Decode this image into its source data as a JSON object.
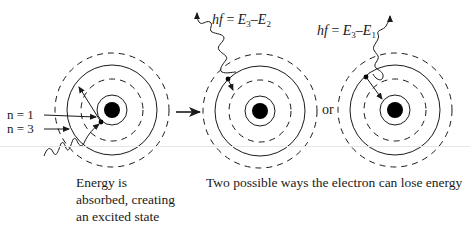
{
  "diagram": {
    "colors": {
      "ink": "#1a1a1a",
      "background": "#ffffff"
    },
    "atoms": [
      {
        "id": "absorbing-atom",
        "center": [
          112,
          110
        ],
        "labels": {
          "n1": "n = 1",
          "n3": "n = 3"
        },
        "caption_lines": [
          "Energy is",
          "absorbed, creating",
          "an excited state"
        ]
      },
      {
        "id": "emission-e3-e2",
        "center": [
          260,
          111
        ],
        "equation": {
          "lhs": "hf",
          "eq": " = ",
          "e_a": "E",
          "sub_a": "3",
          "minus": "–",
          "e_b": "E",
          "sub_b": "2"
        }
      },
      {
        "id": "emission-e3-e1",
        "center": [
          395,
          110
        ],
        "equation": {
          "lhs": "hf",
          "eq": " = ",
          "e_a": "E",
          "sub_a": "3",
          "minus": "–",
          "e_b": "E",
          "sub_b": "1"
        }
      }
    ],
    "connector_word": "or",
    "bottom_caption": "Two possible ways the electron can lose energy",
    "rings": [
      {
        "r": 15,
        "style": "solid"
      },
      {
        "r": 31,
        "style": "dashed"
      },
      {
        "r": 45,
        "style": "solid"
      },
      {
        "r": 57,
        "style": "dashed"
      }
    ],
    "nucleus_radius": 8
  }
}
